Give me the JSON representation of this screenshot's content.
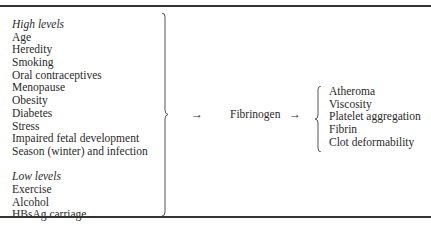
{
  "table": {
    "high_levels": {
      "heading": "High levels",
      "items": [
        "Age",
        "Heredity",
        "Smoking",
        "Oral contraceptives",
        "Menopause",
        "Obesity",
        "Diabetes",
        "Stress",
        "Impaired fetal development",
        "Season (winter) and infection"
      ]
    },
    "low_levels": {
      "heading": "Low levels",
      "items": [
        "Exercise",
        "Alcohol",
        "HBsAg carriage"
      ]
    },
    "arrow_symbol": "→",
    "center": "Fibrinogen",
    "effects": [
      "Atheroma",
      "Viscosity",
      "Platelet aggregation",
      "Fibrin",
      "Clot deformability"
    ]
  }
}
